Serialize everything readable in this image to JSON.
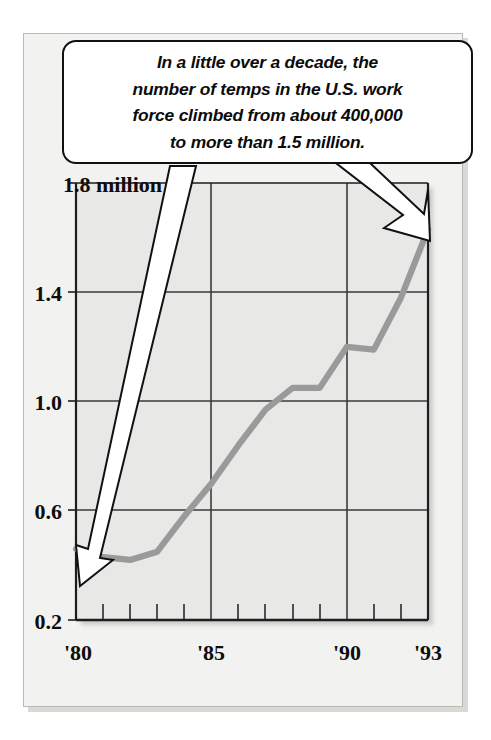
{
  "callout": {
    "lines": [
      "In a little over a decade, the",
      "number of temps in the U.S. work",
      "force climbed from about 400,000",
      "to more than 1.5 million."
    ],
    "text": "In a little over a decade, the number of temps in the U.S. work force climbed from about 400,000 to more than 1.5 million."
  },
  "annotations": {
    "left_arrow_name": "arrow-to-start-of-line",
    "right_arrow_name": "arrow-to-end-of-line"
  },
  "colors": {
    "line": "#9a9a9a",
    "grid": "#3a3a3a",
    "axis": "#222222",
    "plot_bg": "#e8e8e6",
    "page_bg": "#f2f2f0",
    "callout_bg": "#ffffff",
    "text": "#0d0d0d"
  },
  "chart_data": {
    "type": "line",
    "title": "",
    "subtitle": "",
    "xlabel": "",
    "ylabel": "",
    "units": "millions of temporary workers",
    "grid": true,
    "legend": "none",
    "xlim": [
      1980,
      1993
    ],
    "ylim": [
      0.2,
      1.8
    ],
    "y_ticks": [
      0.2,
      0.6,
      1.0,
      1.4,
      1.8
    ],
    "y_tick_labels": [
      "0.2",
      "0.6",
      "1.0",
      "1.4",
      "1.8 million"
    ],
    "x_ticks": [
      1980,
      1981,
      1982,
      1983,
      1984,
      1985,
      1986,
      1987,
      1988,
      1989,
      1990,
      1991,
      1992,
      1993
    ],
    "x_tick_labels": [
      "'80",
      "",
      "",
      "",
      "",
      "'85",
      "",
      "",
      "",
      "",
      "'90",
      "",
      "",
      "'93"
    ],
    "x_major_gridlines": [
      1985,
      1990
    ],
    "x_labels_shown": [
      "'80",
      "'85",
      "'90",
      "'93"
    ],
    "series": [
      {
        "name": "U.S. temporary workers",
        "x": [
          1980,
          1981,
          1982,
          1983,
          1984,
          1985,
          1986,
          1987,
          1988,
          1989,
          1990,
          1991,
          1992,
          1993
        ],
        "values": [
          0.46,
          0.43,
          0.42,
          0.45,
          0.58,
          0.7,
          0.84,
          0.97,
          1.05,
          1.05,
          1.2,
          1.19,
          1.38,
          1.63
        ]
      }
    ]
  }
}
